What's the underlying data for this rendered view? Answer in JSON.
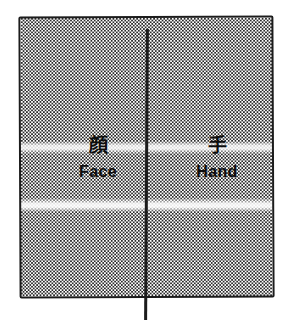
{
  "figure": {
    "panels": [
      {
        "id": "left-panel",
        "kanji": "顔",
        "label": "Face"
      },
      {
        "id": "right-panel",
        "kanji": "手",
        "label": "Hand"
      }
    ],
    "colors": {
      "ink": "#1c1c1c",
      "dot": "#2b2b2b",
      "background": "#ffffff",
      "text": "#0d0d0d"
    }
  }
}
